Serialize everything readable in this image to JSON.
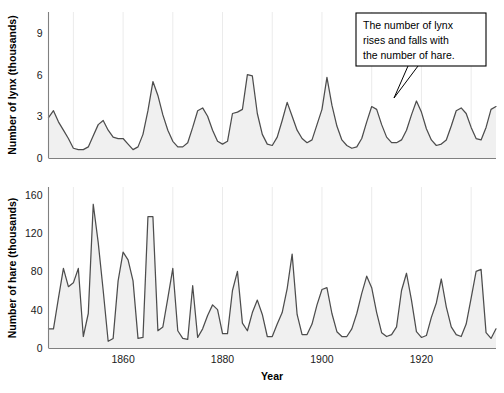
{
  "figure": {
    "background_color": "#ffffff",
    "line_color": "#4d4d4d",
    "grid_color": "#ebebeb",
    "axis_color": "#808080",
    "xlabel": "Year",
    "annotation": {
      "line1": "The number of lynx",
      "line2": "rises and falls with",
      "line3": "the number of hare.",
      "text": "The number of lynx rises and falls with the number of hare."
    }
  },
  "chart_data": [
    {
      "type": "area",
      "title": "",
      "xlabel": "",
      "ylabel": "Number of lynx (thousands)",
      "xlim": [
        1845,
        1935
      ],
      "ylim": [
        0,
        10.5
      ],
      "yticks": [
        0,
        3,
        6,
        9
      ],
      "ytick_labels": [
        "0",
        "3",
        "6",
        "9"
      ],
      "xticks": [
        1860,
        1880,
        1900,
        1920
      ],
      "xtick_labels": [
        "1860",
        "1880",
        "1900",
        "1920"
      ],
      "grid": true,
      "grid_axis": "x",
      "grid_spacing_years": 10,
      "series_name": "Lynx",
      "x": [
        1845,
        1846,
        1847,
        1848,
        1849,
        1850,
        1851,
        1852,
        1853,
        1854,
        1855,
        1856,
        1857,
        1858,
        1859,
        1860,
        1861,
        1862,
        1863,
        1864,
        1865,
        1866,
        1867,
        1868,
        1869,
        1870,
        1871,
        1872,
        1873,
        1874,
        1875,
        1876,
        1877,
        1878,
        1879,
        1880,
        1881,
        1882,
        1883,
        1884,
        1885,
        1886,
        1887,
        1888,
        1889,
        1890,
        1891,
        1892,
        1893,
        1894,
        1895,
        1896,
        1897,
        1898,
        1899,
        1900,
        1901,
        1902,
        1903,
        1904,
        1905,
        1906,
        1907,
        1908,
        1909,
        1910,
        1911,
        1912,
        1913,
        1914,
        1915,
        1916,
        1917,
        1918,
        1919,
        1920,
        1921,
        1922,
        1923,
        1924,
        1925,
        1926,
        1927,
        1928,
        1929,
        1930,
        1931,
        1932,
        1933,
        1934,
        1935
      ],
      "y": [
        2.9,
        3.4,
        2.6,
        2.0,
        1.4,
        0.7,
        0.6,
        0.6,
        0.8,
        1.6,
        2.4,
        2.7,
        2.0,
        1.5,
        1.4,
        1.4,
        1.0,
        0.6,
        0.8,
        1.7,
        3.4,
        5.5,
        4.5,
        3.1,
        2.0,
        1.2,
        0.8,
        0.8,
        1.1,
        2.2,
        3.4,
        3.6,
        3.0,
        2.0,
        1.2,
        1.0,
        1.2,
        3.2,
        3.3,
        3.5,
        6.0,
        5.9,
        3.2,
        1.7,
        1.0,
        0.9,
        1.5,
        2.7,
        4.0,
        3.0,
        2.0,
        1.4,
        1.1,
        1.3,
        2.4,
        3.5,
        5.8,
        3.8,
        2.3,
        1.3,
        0.9,
        0.7,
        0.8,
        1.4,
        2.6,
        3.7,
        3.5,
        2.4,
        1.5,
        1.1,
        1.1,
        1.3,
        2.0,
        3.1,
        4.1,
        3.3,
        2.1,
        1.3,
        0.9,
        1.0,
        1.3,
        2.3,
        3.4,
        3.6,
        3.2,
        2.2,
        1.4,
        1.3,
        2.2,
        3.5,
        3.7
      ],
      "fill": "#f0f0f0"
    },
    {
      "type": "area",
      "title": "",
      "xlabel": "Year",
      "ylabel": "Number of hare (thousands)",
      "xlim": [
        1845,
        1935
      ],
      "ylim": [
        0,
        168
      ],
      "yticks": [
        0,
        40,
        80,
        120,
        160
      ],
      "ytick_labels": [
        "0",
        "40",
        "80",
        "120",
        "160"
      ],
      "xticks": [
        1860,
        1880,
        1900,
        1920
      ],
      "xtick_labels": [
        "1860",
        "1880",
        "1900",
        "1920"
      ],
      "grid": true,
      "grid_axis": "x",
      "grid_spacing_years": 10,
      "series_name": "Hare",
      "x": [
        1845,
        1846,
        1847,
        1848,
        1849,
        1850,
        1851,
        1852,
        1853,
        1854,
        1855,
        1856,
        1857,
        1858,
        1859,
        1860,
        1861,
        1862,
        1863,
        1864,
        1865,
        1866,
        1867,
        1868,
        1869,
        1870,
        1871,
        1872,
        1873,
        1874,
        1875,
        1876,
        1877,
        1878,
        1879,
        1880,
        1881,
        1882,
        1883,
        1884,
        1885,
        1886,
        1887,
        1888,
        1889,
        1890,
        1891,
        1892,
        1893,
        1894,
        1895,
        1896,
        1897,
        1898,
        1899,
        1900,
        1901,
        1902,
        1903,
        1904,
        1905,
        1906,
        1907,
        1908,
        1909,
        1910,
        1911,
        1912,
        1913,
        1914,
        1915,
        1916,
        1917,
        1918,
        1919,
        1920,
        1921,
        1922,
        1923,
        1924,
        1925,
        1926,
        1927,
        1928,
        1929,
        1930,
        1931,
        1932,
        1933,
        1934,
        1935
      ],
      "y": [
        20,
        20,
        52,
        83,
        64,
        68,
        83,
        12,
        36,
        150,
        110,
        60,
        7,
        10,
        70,
        100,
        92,
        70,
        10,
        11,
        137,
        137,
        18,
        22,
        52,
        83,
        18,
        10,
        9,
        65,
        11,
        20,
        34,
        45,
        40,
        15,
        15,
        60,
        80,
        26,
        18,
        37,
        50,
        35,
        12,
        12,
        25,
        37,
        62,
        98,
        35,
        14,
        14,
        25,
        45,
        61,
        63,
        36,
        17,
        12,
        12,
        20,
        36,
        57,
        75,
        63,
        37,
        16,
        12,
        14,
        22,
        60,
        78,
        50,
        17,
        11,
        13,
        32,
        47,
        72,
        43,
        22,
        14,
        12,
        25,
        52,
        80,
        82,
        16,
        10,
        20
      ],
      "fill": "#f0f0f0"
    }
  ]
}
